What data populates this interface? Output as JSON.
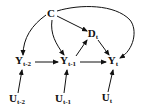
{
  "diagram": {
    "type": "causal-dag",
    "nodes": [
      {
        "id": "C",
        "base": "C",
        "sub": "",
        "x": 51,
        "y": 13
      },
      {
        "id": "Dt",
        "base": "D",
        "sub": "t",
        "x": 93,
        "y": 35
      },
      {
        "id": "Yt2",
        "base": "Y",
        "sub": "t-2",
        "x": 23,
        "y": 62
      },
      {
        "id": "Yt1",
        "base": "Y",
        "sub": "t-1",
        "x": 68,
        "y": 62
      },
      {
        "id": "Yt",
        "base": "Y",
        "sub": "t",
        "x": 113,
        "y": 62
      },
      {
        "id": "Ut2",
        "base": "U",
        "sub": "t-2",
        "x": 17,
        "y": 100
      },
      {
        "id": "Ut1",
        "base": "U",
        "sub": "t-1",
        "x": 63,
        "y": 100
      },
      {
        "id": "Ut",
        "base": "U",
        "sub": "t",
        "x": 107,
        "y": 99
      }
    ],
    "edges": [
      {
        "from": "C",
        "to": "Yt2"
      },
      {
        "from": "C",
        "to": "Yt1"
      },
      {
        "from": "C",
        "to": "Dt"
      },
      {
        "from": "C",
        "to": "Yt"
      },
      {
        "from": "Yt1",
        "to": "Dt"
      },
      {
        "from": "Dt",
        "to": "Yt"
      },
      {
        "from": "Yt2",
        "to": "Yt1"
      },
      {
        "from": "Yt1",
        "to": "Yt"
      },
      {
        "from": "Ut2",
        "to": "Yt2"
      },
      {
        "from": "Ut1",
        "to": "Yt1"
      },
      {
        "from": "Ut",
        "to": "Yt"
      }
    ],
    "colors": {
      "stroke": "#111111",
      "background": "#ffffff"
    }
  }
}
